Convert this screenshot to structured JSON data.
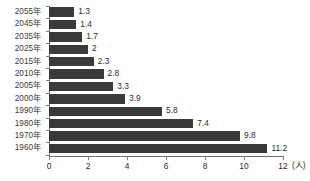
{
  "chart_data": {
    "type": "bar",
    "orientation": "horizontal",
    "title": "",
    "xlabel": "(人)",
    "ylabel": "",
    "xlim": [
      0,
      12
    ],
    "xticks": [
      0,
      2,
      4,
      6,
      8,
      10,
      12
    ],
    "xtick_labels": [
      "0",
      "2",
      "4",
      "6",
      "8",
      "10",
      "12"
    ],
    "unit": "(人)",
    "grid": false,
    "legend": null,
    "bar_color": "#3a3a3a",
    "axis_color": "#707070",
    "categories": [
      "2055年",
      "2045年",
      "2035年",
      "2025年",
      "2015年",
      "2010年",
      "2005年",
      "2000年",
      "1990年",
      "1980年",
      "1970年",
      "1960年"
    ],
    "values": [
      1.3,
      1.4,
      1.7,
      2,
      2.3,
      2.8,
      3.3,
      3.9,
      5.8,
      7.4,
      9.8,
      11.2
    ],
    "value_labels": [
      "1.3",
      "1.4",
      "1.7",
      "2",
      "2.3",
      "2.8",
      "3.3",
      "3.9",
      "5.8",
      "7.4",
      "9.8",
      "11.2"
    ]
  },
  "footnote": {
    "text": ""
  }
}
